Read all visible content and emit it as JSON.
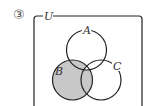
{
  "problem_number": "③",
  "diagram": {
    "type": "venn",
    "universe_label": "U",
    "sets": [
      {
        "label": "A",
        "cx": 86.5,
        "cy": 50,
        "r": 20
      },
      {
        "label": "B",
        "cx": 72.5,
        "cy": 80,
        "r": 20
      },
      {
        "label": "C",
        "cx": 101,
        "cy": 80,
        "r": 20
      }
    ],
    "shaded_region": "B minus (A ∩ B ∩ C)",
    "shade_color": "#c8c8c8",
    "line_color": "#222222"
  }
}
